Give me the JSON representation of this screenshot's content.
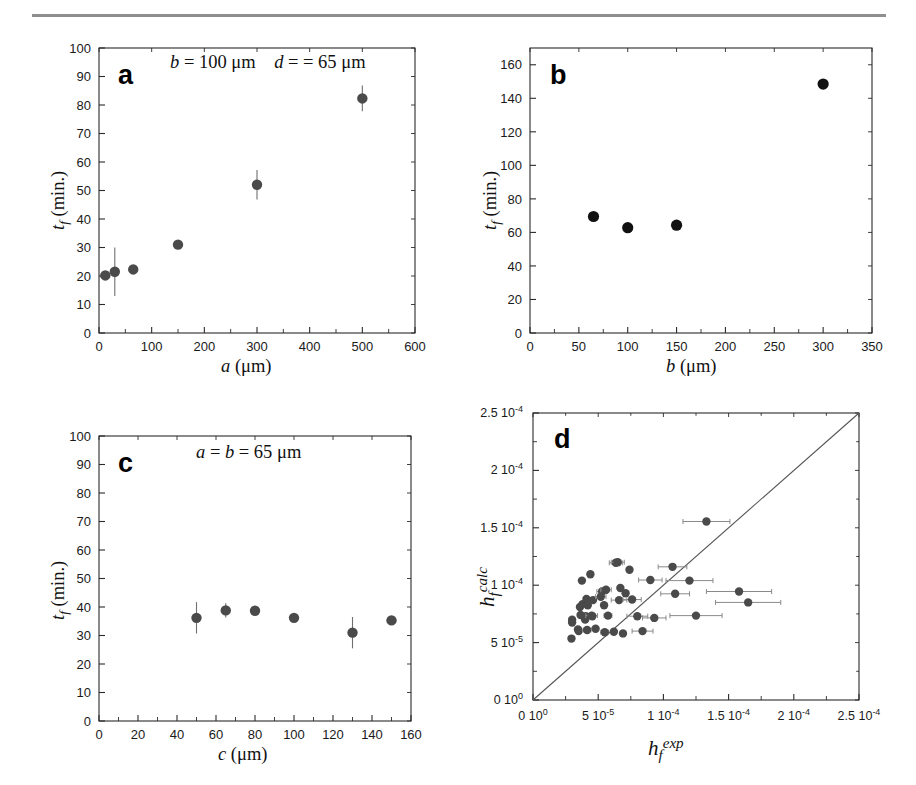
{
  "figure": {
    "background": "#ffffff",
    "rule_color": "#8e8e8e",
    "marker_color": "#4a4a4a",
    "marker_color_b": "#111111",
    "errorbar_color": "#6f6f6f",
    "diagonal_color": "#555555"
  },
  "chart_data": [
    {
      "type": "scatter",
      "panel": "a",
      "panel_letter": "a",
      "annotation": "b = 100 μm   d = = 65 μm",
      "annotation_parts": {
        "b_label": "b",
        "b_value": "= 100 μm",
        "d_label": "d",
        "d_value": "= = 65 μm"
      },
      "title": "",
      "xlabel": "a (μm)",
      "xlabel_symbol": "a",
      "xlabel_units": "(μm)",
      "ylabel": "t_f (min.)",
      "ylabel_symbol": "t",
      "ylabel_subscript": "f",
      "ylabel_units": "(min.)",
      "xlim": [
        0,
        600
      ],
      "ylim": [
        0,
        100
      ],
      "xticks": [
        0,
        100,
        200,
        300,
        400,
        500,
        600
      ],
      "yticks": [
        0,
        10,
        20,
        30,
        40,
        50,
        60,
        70,
        80,
        90,
        100
      ],
      "xticklabels": [
        "0",
        "100",
        "200",
        "300",
        "400",
        "500",
        "600"
      ],
      "yticklabels": [
        "0",
        "10",
        "20",
        "30",
        "40",
        "50",
        "60",
        "70",
        "80",
        "90",
        "100"
      ],
      "grid": false,
      "legend": "none",
      "x": [
        12,
        30,
        65,
        150,
        300,
        500
      ],
      "y": [
        20.2,
        21.5,
        22.3,
        31.0,
        52.0,
        82.3
      ],
      "yerr": [
        1.5,
        8.5,
        1.2,
        1.5,
        5.2,
        4.5
      ]
    },
    {
      "type": "scatter",
      "panel": "b",
      "panel_letter": "b",
      "annotation": "",
      "title": "",
      "xlabel": "b (μm)",
      "xlabel_symbol": "b",
      "xlabel_units": "(μm)",
      "ylabel": "t_f (min.)",
      "ylabel_symbol": "t",
      "ylabel_subscript": "f",
      "ylabel_units": "(min.)",
      "xlim": [
        0,
        350
      ],
      "ylim": [
        0,
        170
      ],
      "xticks": [
        0,
        50,
        100,
        150,
        200,
        250,
        300,
        350
      ],
      "yticks": [
        0,
        20,
        40,
        60,
        80,
        100,
        120,
        140,
        160
      ],
      "xticklabels": [
        "0",
        "50",
        "100",
        "150",
        "200",
        "250",
        "300",
        "350"
      ],
      "yticklabels": [
        "0",
        "20",
        "40",
        "60",
        "80",
        "100",
        "120",
        "140",
        "160"
      ],
      "grid": false,
      "legend": "none",
      "x": [
        65,
        100,
        150,
        300
      ],
      "y": [
        69.5,
        62.8,
        64.3,
        148.5
      ],
      "yerr": [
        0,
        0,
        0,
        0
      ]
    },
    {
      "type": "scatter",
      "panel": "c",
      "panel_letter": "c",
      "annotation": "a = b = 65 μm",
      "annotation_parts": {
        "a_label": "a",
        "eq1": "=",
        "b_label": "b",
        "value": "= 65 μm"
      },
      "title": "",
      "xlabel": "c (μm)",
      "xlabel_symbol": "c",
      "xlabel_units": "(μm)",
      "ylabel": "t_f (min.)",
      "ylabel_symbol": "t",
      "ylabel_subscript": "f",
      "ylabel_units": "(min.)",
      "xlim": [
        0,
        160
      ],
      "ylim": [
        0,
        100
      ],
      "xticks": [
        0,
        20,
        40,
        60,
        80,
        100,
        120,
        140,
        160
      ],
      "yticks": [
        0,
        10,
        20,
        30,
        40,
        50,
        60,
        70,
        80,
        90,
        100
      ],
      "xticklabels": [
        "0",
        "20",
        "40",
        "60",
        "80",
        "100",
        "120",
        "140",
        "160"
      ],
      "yticklabels": [
        "0",
        "10",
        "20",
        "30",
        "40",
        "50",
        "60",
        "70",
        "80",
        "90",
        "100"
      ],
      "grid": false,
      "legend": "none",
      "x": [
        50,
        65,
        80,
        100,
        130,
        150
      ],
      "y": [
        36.2,
        38.8,
        38.7,
        36.2,
        31.0,
        35.3
      ],
      "yerr": [
        5.5,
        2.5,
        1.0,
        0.8,
        5.5,
        0.8
      ]
    },
    {
      "type": "scatter",
      "panel": "d",
      "panel_letter": "d",
      "annotation": "",
      "title": "",
      "xlabel": "h_f^exp",
      "xlabel_symbol": "h",
      "xlabel_subscript": "f",
      "xlabel_superscript": "exp",
      "ylabel": "h_f^calc",
      "ylabel_symbol": "h",
      "ylabel_subscript": "f",
      "ylabel_superscript": "calc",
      "xlim": [
        0,
        0.00025
      ],
      "ylim": [
        0,
        0.00025
      ],
      "xticks": [
        0,
        5e-05,
        0.0001,
        0.00015,
        0.0002,
        0.00025
      ],
      "yticks": [
        0,
        5e-05,
        0.0001,
        0.00015,
        0.0002,
        0.00025
      ],
      "xticklabels": [
        "0 10",
        "5 10",
        "1 10",
        "1.5 10",
        "2 10",
        "2.5 10"
      ],
      "xtickexponents": [
        "0",
        "-5",
        "-4",
        "-4",
        "-4",
        "-4"
      ],
      "yticklabels": [
        "0 10",
        "5 10",
        "1 10",
        "1.5 10",
        "2 10",
        "2.5 10"
      ],
      "ytickexponents": [
        "0",
        "-5",
        "-4",
        "-4",
        "-4",
        "-4"
      ],
      "grid": false,
      "legend": "none",
      "reference_line": {
        "type": "identity",
        "label": "y = x",
        "from": [
          0,
          0
        ],
        "to": [
          0.00025,
          0.00025
        ]
      },
      "points": [
        {
          "x": 2.95e-05,
          "y": 5.35e-05,
          "xerr": 0.0
        },
        {
          "x": 3e-05,
          "y": 7e-05,
          "xerr": 0.0
        },
        {
          "x": 3e-05,
          "y": 6.75e-05,
          "xerr": 0.0
        },
        {
          "x": 3.45e-05,
          "y": 6.15e-05,
          "xerr": 0.0
        },
        {
          "x": 3.5e-05,
          "y": 6e-05,
          "xerr": 0.0
        },
        {
          "x": 3.6e-05,
          "y": 8.1e-05,
          "xerr": 0.0
        },
        {
          "x": 3.65e-05,
          "y": 7.4e-05,
          "xerr": 1.5e-06
        },
        {
          "x": 3.75e-05,
          "y": 0.000104,
          "xerr": 0.0
        },
        {
          "x": 3.8e-05,
          "y": 8.35e-05,
          "xerr": 0.0
        },
        {
          "x": 4e-05,
          "y": 7e-05,
          "xerr": 0.0
        },
        {
          "x": 4.05e-05,
          "y": 7.3e-05,
          "xerr": 1.5e-06
        },
        {
          "x": 4.1e-05,
          "y": 8.8e-05,
          "xerr": 0.0
        },
        {
          "x": 4.15e-05,
          "y": 6.1e-05,
          "xerr": 3e-06
        },
        {
          "x": 4.2e-05,
          "y": 8.25e-05,
          "xerr": 0.0
        },
        {
          "x": 4.4e-05,
          "y": 0.0001095,
          "xerr": 0.0
        },
        {
          "x": 4.5e-05,
          "y": 7.35e-05,
          "xerr": 4.5e-06
        },
        {
          "x": 4.55e-05,
          "y": 7.3e-05,
          "xerr": 0.0
        },
        {
          "x": 4.6e-05,
          "y": 8.7e-05,
          "xerr": 0.0
        },
        {
          "x": 4.8e-05,
          "y": 6.2e-05,
          "xerr": 0.0
        },
        {
          "x": 5.2e-05,
          "y": 9e-05,
          "xerr": 4e-06
        },
        {
          "x": 5.3e-05,
          "y": 9.45e-05,
          "xerr": 4e-06
        },
        {
          "x": 5.45e-05,
          "y": 8.25e-05,
          "xerr": 0.0
        },
        {
          "x": 5.5e-05,
          "y": 5.9e-05,
          "xerr": 3e-06
        },
        {
          "x": 5.6e-05,
          "y": 9.6e-05,
          "xerr": 4e-06
        },
        {
          "x": 5.75e-05,
          "y": 7.35e-05,
          "xerr": 3e-06
        },
        {
          "x": 6.2e-05,
          "y": 5.95e-05,
          "xerr": 0.0
        },
        {
          "x": 6.35e-05,
          "y": 0.0001195,
          "xerr": 5e-06
        },
        {
          "x": 6.5e-05,
          "y": 0.00012,
          "xerr": 5e-06
        },
        {
          "x": 6.6e-05,
          "y": 8.7e-05,
          "xerr": 6e-06
        },
        {
          "x": 6.7e-05,
          "y": 9.75e-05,
          "xerr": 0.0
        },
        {
          "x": 6.9e-05,
          "y": 5.8e-05,
          "xerr": 0.0
        },
        {
          "x": 7.1e-05,
          "y": 9.3e-05,
          "xerr": 0.0
        },
        {
          "x": 7.4e-05,
          "y": 0.0001135,
          "xerr": 0.0
        },
        {
          "x": 7.6e-05,
          "y": 8.75e-05,
          "xerr": 7e-06
        },
        {
          "x": 8e-05,
          "y": 7.3e-05,
          "xerr": 8e-06
        },
        {
          "x": 8.4e-05,
          "y": 6e-05,
          "xerr": 8e-06
        },
        {
          "x": 9e-05,
          "y": 0.0001045,
          "xerr": 9e-06
        },
        {
          "x": 9.3e-05,
          "y": 7.15e-05,
          "xerr": 9e-06
        },
        {
          "x": 0.000107,
          "y": 0.000116,
          "xerr": 1.1e-05
        },
        {
          "x": 0.000109,
          "y": 9.25e-05,
          "xerr": 1.1e-05
        },
        {
          "x": 0.00012,
          "y": 0.000104,
          "xerr": 1.8e-05
        },
        {
          "x": 0.000125,
          "y": 7.35e-05,
          "xerr": 2e-05
        },
        {
          "x": 0.000133,
          "y": 0.0001555,
          "xerr": 1.8e-05
        },
        {
          "x": 0.000158,
          "y": 9.45e-05,
          "xerr": 2.5e-05
        },
        {
          "x": 0.000165,
          "y": 8.5e-05,
          "xerr": 2.5e-05
        }
      ]
    }
  ]
}
